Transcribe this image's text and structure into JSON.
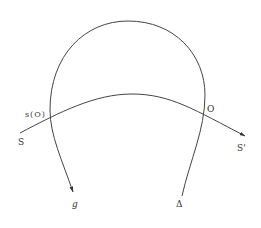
{
  "diagram": {
    "labels": {
      "s_O": "s(O)",
      "S": "S",
      "O": "O",
      "S_prime": "S'",
      "g": "g",
      "delta": "Δ"
    },
    "colors": {
      "stroke": "#444444",
      "text": "#333333",
      "background": "#ffffff"
    }
  }
}
